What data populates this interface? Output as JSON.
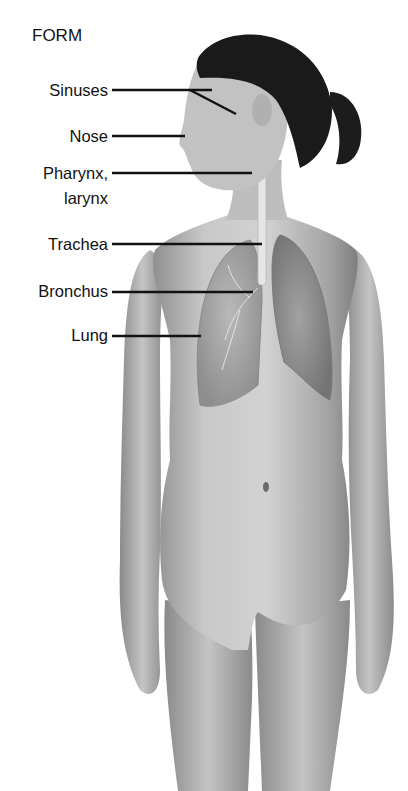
{
  "title": "FORM",
  "labels": [
    {
      "id": "sinuses",
      "text": "Sinuses",
      "x_right": 108,
      "y": 80
    },
    {
      "id": "nose",
      "text": "Nose",
      "x_right": 108,
      "y": 126
    },
    {
      "id": "pharynx",
      "text": "Pharynx,",
      "x_right": 108,
      "y": 163
    },
    {
      "id": "larynx",
      "text": "larynx",
      "x_right": 108,
      "y": 188
    },
    {
      "id": "trachea",
      "text": "Trachea",
      "x_right": 108,
      "y": 234
    },
    {
      "id": "bronchus",
      "text": "Bronchus",
      "x_right": 108,
      "y": 281
    },
    {
      "id": "lung",
      "text": "Lung",
      "x_right": 108,
      "y": 325
    }
  ],
  "colors": {
    "background": "#ffffff",
    "text": "#111111",
    "leader_line": "#111111",
    "skin_light": "#cfcfcf",
    "skin_mid": "#a9a9a9",
    "skin_dark": "#7a7a7a",
    "hair": "#1a1a1a"
  }
}
